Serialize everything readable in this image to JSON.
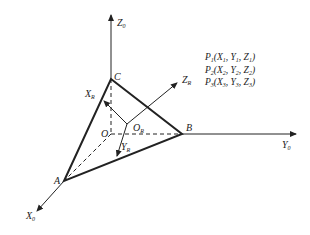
{
  "diagram": {
    "title": "",
    "points": {
      "O": {
        "label": "O"
      },
      "A": {
        "label": "A"
      },
      "B": {
        "label": "B"
      },
      "C": {
        "label": "C"
      },
      "OR": {
        "label": "O",
        "sub": "R"
      }
    },
    "axes": {
      "world": {
        "z": {
          "label": "Z",
          "sub": "0"
        },
        "y": {
          "label": "Y",
          "sub": "0"
        },
        "x": {
          "label": "X",
          "sub": "0"
        }
      },
      "robot": {
        "z": {
          "label": "Z",
          "sub": "R"
        },
        "x": {
          "label": "X",
          "sub": "R"
        },
        "y": {
          "label": "Y",
          "sub": "R"
        }
      }
    },
    "point_list": [
      {
        "p": "P",
        "ps": "1",
        "x": "X",
        "xs": "1",
        "y": "Y",
        "ys": "1",
        "z": "Z",
        "zs": "1"
      },
      {
        "p": "P",
        "ps": "2",
        "x": "X",
        "xs": "2",
        "y": "Y",
        "ys": "2",
        "z": "Z",
        "zs": "2"
      },
      {
        "p": "P",
        "ps": "3",
        "x": "X",
        "xs": "3",
        "y": "Y",
        "ys": "3",
        "z": "Z",
        "zs": "3"
      }
    ],
    "colors": {
      "line": "#222222",
      "background": "#ffffff"
    }
  }
}
